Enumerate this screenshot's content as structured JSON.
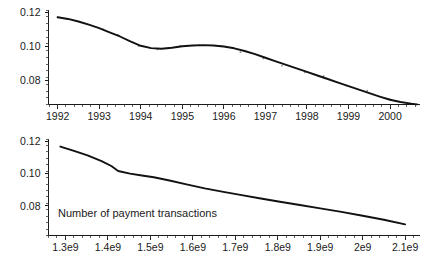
{
  "figure": {
    "background_color": "#ffffff",
    "curve_color": "#111111",
    "axis_color": "#1a1a1a",
    "point_color": "#8a8a8a"
  },
  "chart_data": [
    {
      "id": "top",
      "type": "line",
      "title": "",
      "xlabel": "",
      "ylabel": "",
      "xlim": [
        1991.78,
        2000.72
      ],
      "ylim": [
        0.0655,
        0.1215
      ],
      "grid": false,
      "legend": null,
      "xtick_labels": [
        "1992",
        "1993",
        "1994",
        "1995",
        "1996",
        "1997",
        "1998",
        "1999",
        "2000"
      ],
      "xtick_values": [
        1992,
        1993,
        1994,
        1995,
        1996,
        1997,
        1998,
        1999,
        2000
      ],
      "ytick_labels": [
        "0.12",
        "0.10",
        "0.08"
      ],
      "ytick_values": [
        0.12,
        0.1,
        0.08
      ],
      "x": [
        1992.0,
        1992.25,
        1992.5,
        1992.75,
        1993.0,
        1993.25,
        1993.5,
        1993.75,
        1994.0,
        1994.25,
        1994.5,
        1994.75,
        1995.0,
        1995.25,
        1995.5,
        1995.75,
        1996.0,
        1996.25,
        1996.5,
        1996.75,
        1997.0,
        1997.25,
        1997.5,
        1997.75,
        1998.0,
        1998.25,
        1998.5,
        1998.75,
        1999.0,
        1999.25,
        1999.5,
        1999.75,
        2000.0,
        2000.25,
        2000.5,
        2000.65
      ],
      "y": [
        0.1172,
        0.1162,
        0.1147,
        0.1128,
        0.1107,
        0.1083,
        0.1058,
        0.1029,
        0.1003,
        0.0989,
        0.0985,
        0.0991,
        0.1,
        0.1005,
        0.1007,
        0.1005,
        0.0999,
        0.0988,
        0.0972,
        0.0953,
        0.0932,
        0.0911,
        0.089,
        0.0869,
        0.0848,
        0.0827,
        0.0806,
        0.0785,
        0.0764,
        0.0743,
        0.0722,
        0.0702,
        0.0683,
        0.067,
        0.066,
        0.0656
      ],
      "scatter_x": [
        1992.0,
        1992.45,
        1993.1,
        1993.45,
        1993.95,
        1994.4,
        1994.95,
        1995.4,
        1995.95,
        1996.4,
        1996.95,
        1997.4,
        1997.95,
        1998.4,
        1998.95,
        1999.45,
        2000.0,
        2000.5
      ],
      "scatter_y": [
        0.1172,
        0.115,
        0.11,
        0.1068,
        0.1001,
        0.0982,
        0.1002,
        0.1006,
        0.1,
        0.0965,
        0.0928,
        0.0884,
        0.0846,
        0.0824,
        0.0767,
        0.0737,
        0.0686,
        0.0662
      ]
    },
    {
      "id": "bottom",
      "type": "line",
      "title": "",
      "xlabel": "Number of payment transactions",
      "ylabel": "",
      "xlim": [
        1260000000,
        2135000000
      ],
      "ylim": [
        0.0615,
        0.1215
      ],
      "grid": false,
      "legend": null,
      "annotation": "Number of payment transactions",
      "xtick_labels": [
        "1.3e9",
        "1.4e9",
        "1.5e9",
        "1.6e9",
        "1.7e9",
        "1.8e9",
        "1.9e9",
        "2e9",
        "2.1e9"
      ],
      "xtick_values": [
        1300000000,
        1400000000,
        1500000000,
        1600000000,
        1700000000,
        1800000000,
        1900000000,
        2000000000,
        2100000000
      ],
      "ytick_labels": [
        "0.12",
        "0.10",
        "0.08"
      ],
      "ytick_values": [
        0.12,
        0.1,
        0.08
      ],
      "x": [
        1288000000,
        1320000000,
        1352000000,
        1385000000,
        1408000000,
        1424000000,
        1452000000,
        1480000000,
        1508000000,
        1545000000,
        1585000000,
        1628000000,
        1672000000,
        1715000000,
        1760000000,
        1805000000,
        1852000000,
        1900000000,
        1950000000,
        2000000000,
        2050000000,
        2100000000
      ],
      "y": [
        0.1168,
        0.1141,
        0.1113,
        0.1078,
        0.1047,
        0.1016,
        0.1,
        0.0988,
        0.0977,
        0.0957,
        0.0933,
        0.0908,
        0.0886,
        0.0866,
        0.0845,
        0.0825,
        0.0805,
        0.0784,
        0.0762,
        0.0738,
        0.0713,
        0.0684
      ]
    }
  ]
}
